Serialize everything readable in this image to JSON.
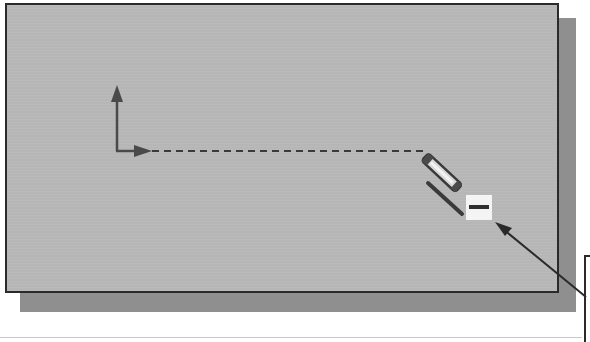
{
  "diagram": {
    "colors": {
      "canvas": "#b6b6b6",
      "shadow": "#8f8f8f",
      "border": "#2a2a2a",
      "axis": "#4a4a4a",
      "indicator_box": "#f4f4f4"
    },
    "elements": {
      "y_axis_arrow": "arrow-up",
      "x_axis_arrow": "arrow-right",
      "rubber_band_line": "dashed",
      "cursor": "pencil-icon",
      "tool_indicator": "line-tool-icon",
      "callout": "leader-arrow"
    }
  }
}
